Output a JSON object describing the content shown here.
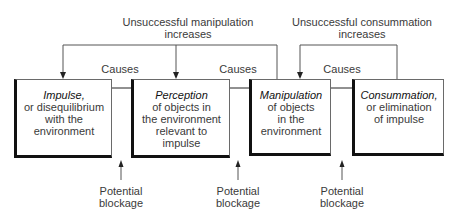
{
  "feedback": [
    {
      "label_line1": "Unsuccessful manipulation",
      "label_line2": "increases"
    },
    {
      "label_line1": "Unsuccessful consummation",
      "label_line2": "increases"
    }
  ],
  "causes_labels": [
    "Causes",
    "Causes",
    "Causes"
  ],
  "boxes": [
    {
      "title": "Impulse,",
      "desc": "or disequilibrium\nwith the\nenvironment"
    },
    {
      "title": "Perception",
      "desc": "of objects in\nthe environment\nrelevant to\nimpulse"
    },
    {
      "title": "Manipulation",
      "desc": "of objects\nin the\nenvironment"
    },
    {
      "title": "Consummation,",
      "desc": "or elimination\nof impulse"
    }
  ],
  "blockages": [
    {
      "line1": "Potential",
      "line2": "blockage"
    },
    {
      "line1": "Potential",
      "line2": "blockage"
    },
    {
      "line1": "Potential",
      "line2": "blockage"
    }
  ],
  "colors": {
    "line": "#555555",
    "box_border_heavy": "#111111",
    "text": "#3a3a3a"
  }
}
